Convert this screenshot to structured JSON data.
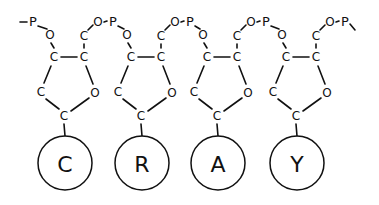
{
  "diagram": {
    "title": "",
    "atom_labels": {
      "phosphorus": "P",
      "oxygen": "O",
      "carbon": "C"
    },
    "nucleotides": [
      {
        "base": "C"
      },
      {
        "base": "R"
      },
      {
        "base": "A"
      },
      {
        "base": "Y"
      }
    ],
    "colors": {
      "ink": "#111111",
      "background": "#ffffff"
    }
  }
}
